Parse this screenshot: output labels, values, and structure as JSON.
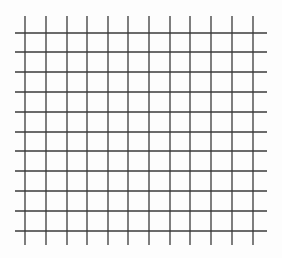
{
  "grid": {
    "line_color": "#3a3a3a",
    "line_width": 1.3,
    "vertical_lines_x": [
      25,
      46,
      67,
      87,
      108,
      128,
      149,
      170,
      190,
      211,
      232,
      253
    ],
    "vertical_span": [
      16,
      245
    ],
    "horizontal_lines_y": [
      33,
      52,
      72,
      92,
      112,
      132,
      151,
      171,
      191,
      211,
      231
    ],
    "horizontal_span": [
      15,
      267
    ],
    "vertical_count": 12,
    "horizontal_count": 11
  }
}
